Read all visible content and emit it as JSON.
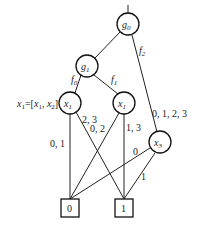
{
  "diagram": {
    "type": "decision-diagram",
    "nodes": [
      {
        "id": "g0",
        "label": "g",
        "sub": "0",
        "shape": "circle"
      },
      {
        "id": "g1",
        "label": "g",
        "sub": "1",
        "shape": "circle"
      },
      {
        "id": "x1a",
        "label": "x",
        "sub": "1",
        "shape": "circle"
      },
      {
        "id": "x1b",
        "label": "x",
        "sub": "1",
        "shape": "circle"
      },
      {
        "id": "x3",
        "label": "x",
        "sub": "3",
        "shape": "circle"
      },
      {
        "id": "t0",
        "label": "0",
        "shape": "square"
      },
      {
        "id": "t1",
        "label": "1",
        "shape": "square"
      }
    ],
    "edge_labels": {
      "g0_g1": "",
      "g0_x3": "f",
      "g0_x3_sub": "2",
      "g1_x1a": "f",
      "g1_x1a_sub": "0",
      "g1_x1b": "f",
      "g1_x1b_sub": "1",
      "x1a_t0": "0, 1",
      "x1a_t1": "2, 3",
      "x1b_t0": "0, 2",
      "x1b_t1": "1, 3",
      "x3_label_top": "0, 1, 2, 3",
      "x3_t0": "0",
      "x3_t1": "1"
    },
    "annotation": {
      "lhs": "x",
      "lhs_sub": "1",
      "eq": "=[",
      "a": "x",
      "a_sub": "1",
      "comma": ", ",
      "b": "x",
      "b_sub": "2",
      "close": "]"
    }
  }
}
